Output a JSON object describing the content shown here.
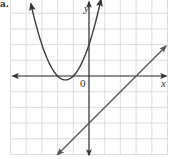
{
  "corner_label": "a.",
  "axes": {
    "x_label": "x",
    "y_label": "y",
    "origin_label": "0"
  },
  "colors": {
    "grid": "#d4d4d4",
    "axis": "#333333",
    "parabola": "#3a3a3a",
    "line": "#555555"
  },
  "chart_data": {
    "type": "line",
    "title": "",
    "xlabel": "x",
    "ylabel": "y",
    "xlim": [
      -5,
      5
    ],
    "ylim": [
      -5,
      5
    ],
    "grid": true,
    "grid_step": 1,
    "tick_labels": [
      "0"
    ],
    "series": [
      {
        "name": "parabola",
        "equation": "y = x^2 + 3x + 2",
        "vertex": [
          -1.5,
          -0.25
        ],
        "x_intercepts": [
          -2,
          -1
        ],
        "y_intercept": 2,
        "x": [
          -3.7,
          -3,
          -2.5,
          -2,
          -1.5,
          -1,
          -0.5,
          0,
          0.5,
          0.76
        ],
        "values": [
          4.59,
          2,
          0.75,
          0,
          -0.25,
          0,
          0.75,
          2,
          3.75,
          4.86
        ]
      },
      {
        "name": "line",
        "equation": "y = x - 3",
        "slope": 1,
        "x_intercept": 3,
        "y_intercept": -3,
        "x": [
          -2,
          0,
          3,
          4.9
        ],
        "values": [
          -5,
          -3,
          0,
          1.9
        ]
      }
    ]
  }
}
